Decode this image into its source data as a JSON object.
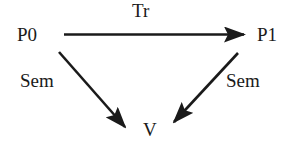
{
  "diagram": {
    "nodes": {
      "p0": {
        "label": "P0"
      },
      "p1": {
        "label": "P1"
      },
      "v": {
        "label": "V"
      }
    },
    "edges": {
      "tr": {
        "label": "Tr",
        "from": "P0",
        "to": "P1"
      },
      "sem_left": {
        "label": "Sem",
        "from": "P0",
        "to": "V"
      },
      "sem_right": {
        "label": "Sem",
        "from": "P1",
        "to": "V"
      }
    },
    "colors": {
      "ink": "#1a1a1a",
      "background": "#ffffff"
    }
  }
}
